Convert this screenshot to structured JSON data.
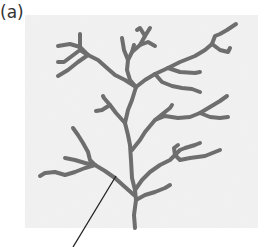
{
  "figure": {
    "panel_label": "(a)",
    "colors": {
      "background_panel": "#efefef",
      "branch_stroke": "#6e6e6e",
      "leader_line": "#222222"
    }
  }
}
